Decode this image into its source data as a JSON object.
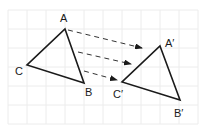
{
  "diagram": {
    "type": "translation",
    "grid": {
      "spacing": 19,
      "x0": 8,
      "y0": 10,
      "cols": 11,
      "rows": 7,
      "color": "#ececec"
    },
    "original": {
      "vertices": {
        "A": {
          "label": "A",
          "x": 65,
          "y": 29
        },
        "B": {
          "label": "B",
          "x": 84,
          "y": 83
        },
        "C": {
          "label": "C",
          "x": 27,
          "y": 65
        }
      }
    },
    "image": {
      "vertices": {
        "A": {
          "label": "A′",
          "x": 160,
          "y": 46
        },
        "B": {
          "label": "B′",
          "x": 180,
          "y": 100
        },
        "C": {
          "label": "C′",
          "x": 122,
          "y": 82
        }
      }
    },
    "arrows": [
      {
        "x1": 68,
        "y1": 30,
        "x2": 142,
        "y2": 48
      },
      {
        "x1": 78,
        "y1": 52,
        "x2": 131,
        "y2": 64
      },
      {
        "x1": 84,
        "y1": 71,
        "x2": 117,
        "y2": 80
      }
    ],
    "labels": {
      "A": "A",
      "B": "B",
      "C": "C",
      "A_prime": "A′",
      "B_prime": "B′",
      "C_prime": "C′"
    },
    "colors": {
      "stroke": "#1a1a1a",
      "arrow": "#333333",
      "background": "#ffffff"
    }
  }
}
